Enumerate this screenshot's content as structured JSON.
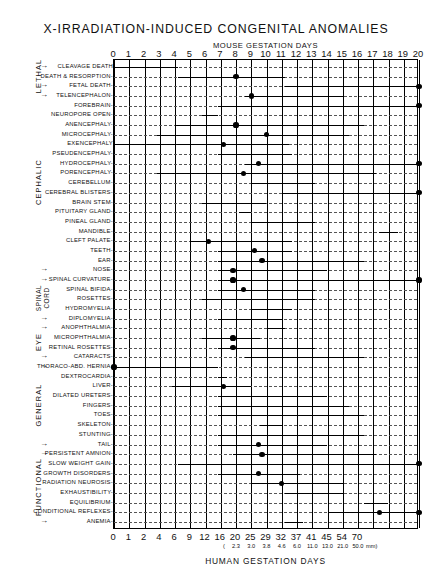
{
  "title": "X-IRRADIATION-INDUCED  CONGENITAL  ANOMALIES",
  "top_axis_title": "MOUSE GESTATION DAYS",
  "bottom_axis_title": "HUMAN GESTATION DAYS",
  "mm_note_open": "(",
  "mm_note_close": "mm)",
  "groups": [
    {
      "name": "LETHAL",
      "label": "LETHAL"
    },
    {
      "name": "CEPHALIC",
      "label": "CEPHALIC"
    },
    {
      "name": "SPINAL-CORD",
      "label": "SPINAL\nCORD"
    },
    {
      "name": "EYE",
      "label": "EYE"
    },
    {
      "name": "GENERAL",
      "label": "GENERAL"
    },
    {
      "name": "FUNCTIONAL",
      "label": "FUNCTIONAL"
    }
  ],
  "chart_data": {
    "type": "bar",
    "title": "X-IRRADIATION-INDUCED  CONGENITAL  ANOMALIES",
    "xlabel": "MOUSE GESTATION DAYS",
    "xlabel_secondary": "HUMAN GESTATION DAYS",
    "ylabel": "",
    "xlim": [
      0,
      20
    ],
    "grid": true,
    "legend": "none",
    "orientation": "horizontal-range-bars",
    "top_ticks": [
      "0",
      "1",
      "2",
      "3",
      "4",
      "5",
      "6",
      "7",
      "8",
      "9",
      "10",
      "11",
      "12",
      "13",
      "14",
      "15",
      "16",
      "17",
      "18",
      "19",
      "20"
    ],
    "top_tick_values": [
      0,
      1,
      2,
      3,
      4,
      5,
      6,
      7,
      8,
      9,
      10,
      11,
      12,
      13,
      14,
      15,
      16,
      17,
      18,
      19,
      20
    ],
    "bottom_ticks": [
      "0",
      "1",
      "2",
      "4",
      "6",
      "9",
      "12",
      "16",
      "20",
      "25",
      "29",
      "32",
      "37",
      "41",
      "45",
      "54",
      "70"
    ],
    "bottom_tick_positions": [
      0,
      1,
      2,
      3,
      4,
      5,
      6,
      7,
      8,
      9,
      10,
      11,
      12,
      13,
      14,
      15,
      16
    ],
    "mm_ticks": [
      "2.3",
      "3.0",
      "3.8",
      "4.6",
      "6.0",
      "11.0",
      "13.0",
      "21.0",
      "50.0"
    ],
    "mm_tick_positions": [
      8,
      9,
      10,
      11,
      12,
      13,
      14,
      15,
      16
    ],
    "categories": [
      "CLEAVAGE DEATH",
      "DEATH & RESORPTION",
      "FETAL DEATH",
      "TELENCEPHALON",
      "FOREBRAIN",
      "NEUROPORE OPEN",
      "ANENCEPHALY",
      "MICROCEPHALY",
      "EXENCEPHALY",
      "PSEUDENCEPHALY",
      "HYDROCEPHALY",
      "PORENCEPHALY",
      "CEREBELLUM",
      "CEREBRAL BLISTERS",
      "BRAIN STEM",
      "PITUITARY GLAND",
      "PINEAL GLAND",
      "MANDIBLE",
      "CLEFT PALATE",
      "TEETH",
      "EAR",
      "NOSE",
      "SPINAL CURVATURE",
      "SPINAL BIFIDA",
      "ROSETTES",
      "HYDROMYELIA",
      "DIPLOMYELIA",
      "ANOPHTHALMIA",
      "MICROPHTHALMIA",
      "RETINAL ROSETTES",
      "CATARACTS",
      "THORACO-ABD. HERNIA",
      "DEXTROCARDIA",
      "LIVER",
      "DILATED URETERS",
      "FINGERS",
      "TOES",
      "SKELETON",
      "STUNTING",
      "TAIL",
      "PERSISTENT AMNION",
      "SLOW WEIGHT GAIN",
      "GROWTH DISORDERS",
      "RADIATION NEUROSIS",
      "EXHAUSTIBILITY",
      "EQUILIBRIUM",
      "CONDITIONAL REFLEXES",
      "ANEMIA"
    ],
    "rows": [
      {
        "label": "CLEAVAGE DEATH",
        "group": "LETHAL",
        "start": 0,
        "end": 4.2,
        "peak": null,
        "open_end": false,
        "label_dashes": ""
      },
      {
        "label": "DEATH & RESORPTION",
        "group": "LETHAL",
        "start": 4.2,
        "end": 11.2,
        "peak": 8.0,
        "open_end": false,
        "label_dashes": "---"
      },
      {
        "label": "FETAL DEATH",
        "group": "LETHAL",
        "start": 11.2,
        "end": 20,
        "peak": null,
        "open_end": true,
        "label_dashes": "---"
      },
      {
        "label": "TELENCEPHALON",
        "group": "CEPHALIC",
        "start": 8.6,
        "end": 15.0,
        "peak": 9.0,
        "open_end": false,
        "label_dashes": "---"
      },
      {
        "label": "FOREBRAIN",
        "group": "CEPHALIC",
        "start": 6.8,
        "end": 20,
        "peak": null,
        "open_end": true,
        "label_dashes": "---"
      },
      {
        "label": "NEUROPORE OPEN",
        "group": "CEPHALIC",
        "start": 5.8,
        "end": 6.8,
        "peak": null,
        "open_end": false,
        "label_dashes": "---"
      },
      {
        "label": "ANENCEPHALY",
        "group": "CEPHALIC",
        "start": 4.0,
        "end": 16.4,
        "peak": 8.0,
        "open_end": false,
        "label_dashes": "---"
      },
      {
        "label": "MICROCEPHALY",
        "group": "CEPHALIC",
        "start": 2.8,
        "end": 15.4,
        "peak": 10.0,
        "open_end": false,
        "label_dashes": "---"
      },
      {
        "label": "EXENCEPHALY",
        "group": "CEPHALIC",
        "start": 0,
        "end": 11.5,
        "peak": 7.2,
        "open_end": false,
        "label_dashes": ""
      },
      {
        "label": "PSEUDENCEPHALY",
        "group": "CEPHALIC",
        "start": 6.8,
        "end": 11.7,
        "peak": null,
        "open_end": false,
        "label_dashes": "---"
      },
      {
        "label": "HYDROCEPHALY",
        "group": "CEPHALIC",
        "start": 8.6,
        "end": 20,
        "peak": 9.5,
        "open_end": true,
        "label_dashes": "---"
      },
      {
        "label": "PORENCEPHALY",
        "group": "CEPHALIC",
        "start": 2.8,
        "end": 17.2,
        "peak": 8.5,
        "open_end": false,
        "label_dashes": "---"
      },
      {
        "label": "CEREBELLUM",
        "group": "CEPHALIC",
        "start": 9.0,
        "end": 13.2,
        "peak": null,
        "open_end": false,
        "label_dashes": "---"
      },
      {
        "label": "CEREBRAL BLISTERS",
        "group": "CEPHALIC",
        "start": 11.0,
        "end": 20,
        "peak": null,
        "open_end": true,
        "label_dashes": "---"
      },
      {
        "label": "BRAIN STEM",
        "group": "CEPHALIC",
        "start": 5.8,
        "end": 10.0,
        "peak": null,
        "open_end": false,
        "label_dashes": "---"
      },
      {
        "label": "PITUITARY GLAND",
        "group": "CEPHALIC",
        "start": 8.2,
        "end": 9.0,
        "peak": null,
        "open_end": false,
        "label_dashes": "---"
      },
      {
        "label": "PINEAL GLAND",
        "group": "CEPHALIC",
        "start": 9.0,
        "end": 13.2,
        "peak": null,
        "open_end": false,
        "label_dashes": "---"
      },
      {
        "label": "MANDIBLE",
        "group": "CEPHALIC",
        "start": 17.4,
        "end": 18.6,
        "peak": null,
        "open_end": false,
        "label_dashes": "---"
      },
      {
        "label": "CLEFT PALATE",
        "group": "CEPHALIC",
        "start": 5.0,
        "end": 11.7,
        "peak": 6.2,
        "open_end": false,
        "label_dashes": "---"
      },
      {
        "label": "TEETH",
        "group": "CEPHALIC",
        "start": 6.8,
        "end": 11.7,
        "peak": 9.2,
        "open_end": false,
        "label_dashes": "---"
      },
      {
        "label": "EAR",
        "group": "CEPHALIC",
        "start": 6.8,
        "end": 16.4,
        "peak": 9.7,
        "open_end": false,
        "label_dashes": "---"
      },
      {
        "label": "NOSE",
        "group": "CEPHALIC",
        "start": 6.8,
        "end": 14.0,
        "peak": 7.8,
        "open_end": false,
        "label_dashes": "---"
      },
      {
        "label": "SPINAL CURVATURE",
        "group": "SPINAL-CORD",
        "start": 6.8,
        "end": 20,
        "peak": 7.8,
        "open_end": true,
        "label_dashes": "---"
      },
      {
        "label": "SPINAL BIFIDA",
        "group": "SPINAL-CORD",
        "start": 6.8,
        "end": 13.2,
        "peak": 8.5,
        "open_end": false,
        "label_dashes": "---"
      },
      {
        "label": "ROSETTES",
        "group": "SPINAL-CORD",
        "start": 5.8,
        "end": 13.2,
        "peak": null,
        "open_end": false,
        "label_dashes": "---"
      },
      {
        "label": "HYDROMYELIA",
        "group": "SPINAL-CORD",
        "start": 9.0,
        "end": 11.7,
        "peak": null,
        "open_end": false,
        "label_dashes": "---"
      },
      {
        "label": "DIPLOMYELIA",
        "group": "SPINAL-CORD",
        "start": 6.8,
        "end": 11.0,
        "peak": null,
        "open_end": false,
        "label_dashes": "---"
      },
      {
        "label": "ANOPHTHALMIA",
        "group": "EYE",
        "start": 10.0,
        "end": 11.2,
        "peak": null,
        "open_end": false,
        "label_dashes": "---"
      },
      {
        "label": "MICROPHTHALMIA",
        "group": "EYE",
        "start": 5.8,
        "end": 9.6,
        "peak": 7.8,
        "open_end": false,
        "label_dashes": "---"
      },
      {
        "label": "RETINAL ROSETTES",
        "group": "EYE",
        "start": 6.8,
        "end": 13.2,
        "peak": 7.8,
        "open_end": false,
        "label_dashes": "---"
      },
      {
        "label": "CATARACTS",
        "group": "EYE",
        "start": 8.6,
        "end": 16.4,
        "peak": null,
        "open_end": false,
        "label_dashes": "---"
      },
      {
        "label": "THORACO-ABD. HERNIA",
        "group": "GENERAL",
        "start": 0,
        "end": 6.8,
        "peak": 0.0,
        "open_end": false,
        "label_dashes": "---"
      },
      {
        "label": "DEXTROCARDIA",
        "group": "GENERAL",
        "start": 6.8,
        "end": 7.4,
        "peak": null,
        "open_end": false,
        "label_dashes": "---"
      },
      {
        "label": "LIVER",
        "group": "GENERAL",
        "start": 3.8,
        "end": 9.0,
        "peak": 7.2,
        "open_end": false,
        "label_dashes": "---"
      },
      {
        "label": "DILATED URETERS",
        "group": "GENERAL",
        "start": 6.8,
        "end": 14.0,
        "peak": null,
        "open_end": false,
        "label_dashes": "---"
      },
      {
        "label": "FINGERS",
        "group": "GENERAL",
        "start": 6.8,
        "end": 15.4,
        "peak": null,
        "open_end": false,
        "label_dashes": "---"
      },
      {
        "label": "TOES",
        "group": "GENERAL",
        "start": 6.8,
        "end": 16.4,
        "peak": null,
        "open_end": false,
        "label_dashes": "---"
      },
      {
        "label": "SKELETON",
        "group": "GENERAL",
        "start": 9.6,
        "end": 11.0,
        "peak": null,
        "open_end": false,
        "label_dashes": "---"
      },
      {
        "label": "STUNTING",
        "group": "GENERAL",
        "start": 6.8,
        "end": 16.4,
        "peak": null,
        "open_end": false,
        "label_dashes": "---"
      },
      {
        "label": "TAIL",
        "group": "GENERAL",
        "start": 6.8,
        "end": 14.0,
        "peak": 9.5,
        "open_end": false,
        "label_dashes": "---"
      },
      {
        "label": "PERSISTENT AMNION",
        "group": "FUNCTIONAL",
        "start": 7.8,
        "end": 17.2,
        "peak": 9.7,
        "open_end": false,
        "label_dashes": "---"
      },
      {
        "label": "SLOW WEIGHT GAIN",
        "group": "FUNCTIONAL",
        "start": 4.2,
        "end": 20,
        "peak": null,
        "open_end": true,
        "label_dashes": "---"
      },
      {
        "label": "GROWTH DISORDERS",
        "group": "FUNCTIONAL",
        "start": 6.8,
        "end": 12.2,
        "peak": 9.5,
        "open_end": false,
        "label_dashes": "---"
      },
      {
        "label": "RADIATION NEUROSIS",
        "group": "FUNCTIONAL",
        "start": 9.0,
        "end": 15.0,
        "peak": 11.0,
        "open_end": false,
        "label_dashes": "---"
      },
      {
        "label": "EXHAUSTIBILITY",
        "group": "FUNCTIONAL",
        "start": 11.2,
        "end": 15.0,
        "peak": null,
        "open_end": false,
        "label_dashes": "---"
      },
      {
        "label": "EQUILIBRIUM",
        "group": "FUNCTIONAL",
        "start": 16.4,
        "end": 18.0,
        "peak": null,
        "open_end": false,
        "label_dashes": "---"
      },
      {
        "label": "CONDITIONAL REFLEXES",
        "group": "FUNCTIONAL",
        "start": 14.0,
        "end": 20,
        "peak": 17.4,
        "open_end": true,
        "label_dashes": "---"
      },
      {
        "label": "ANEMIA",
        "group": "FUNCTIONAL",
        "start": 11.2,
        "end": 12.4,
        "peak": null,
        "open_end": false,
        "label_dashes": "---"
      }
    ]
  }
}
